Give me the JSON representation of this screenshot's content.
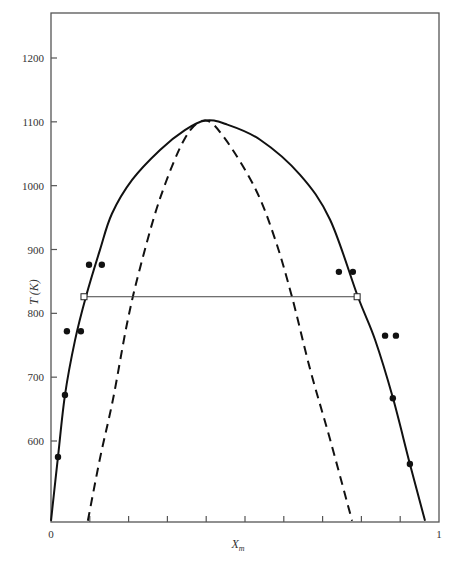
{
  "chart_data": {
    "type": "line",
    "title": "",
    "xlabel": "X_m",
    "xlabel_main": "X",
    "xlabel_sub": "m",
    "ylabel": "T (K)",
    "xlim": [
      0,
      1
    ],
    "ylim": [
      475,
      1270
    ],
    "x_tick_labels": [
      "0",
      "1"
    ],
    "x_ticks": [
      0,
      0.1,
      0.2,
      0.3,
      0.4,
      0.5,
      0.6,
      0.7,
      0.8,
      0.9,
      1.0
    ],
    "y_ticks": [
      600,
      700,
      800,
      900,
      1000,
      1100,
      1200
    ],
    "y_tick_labels": [
      "600",
      "700",
      "800",
      "900",
      "1000",
      "1100",
      "1200"
    ],
    "grid": false,
    "legend": null,
    "series": [
      {
        "name": "binodal (coexistence curve)",
        "style": "solid",
        "x": [
          0.0,
          0.018,
          0.036,
          0.062,
          0.09,
          0.126,
          0.157,
          0.209,
          0.281,
          0.345,
          0.397,
          0.448,
          0.539,
          0.642,
          0.719,
          0.791,
          0.835,
          0.881,
          0.925,
          0.964
        ],
        "y": [
          475,
          575,
          672,
          758,
          826,
          899,
          956,
          1009,
          1056,
          1087,
          1102,
          1097,
          1072,
          1017,
          947,
          826,
          759,
          668,
          564,
          475
        ]
      },
      {
        "name": "spinodal",
        "style": "dashed",
        "x": [
          0.095,
          0.126,
          0.16,
          0.196,
          0.229,
          0.281,
          0.345,
          0.397,
          0.448,
          0.526,
          0.577,
          0.621,
          0.668,
          0.719,
          0.776
        ],
        "y": [
          475,
          572,
          666,
          784,
          870,
          980,
          1074,
          1102,
          1074,
          996,
          917,
          826,
          712,
          603,
          475
        ]
      },
      {
        "name": "experimental points",
        "style": "markers",
        "x": [
          0.018,
          0.036,
          0.041,
          0.077,
          0.098,
          0.131,
          0.742,
          0.778,
          0.861,
          0.889,
          0.881,
          0.925
        ],
        "y": [
          575,
          672,
          772,
          772,
          876,
          876,
          865,
          865,
          765,
          765,
          667,
          564
        ]
      },
      {
        "name": "tie line",
        "style": "solid-thin",
        "x": [
          0.085,
          0.789
        ],
        "y": [
          826,
          826
        ]
      }
    ],
    "annotations": [
      "square markers at tie-line endpoints"
    ]
  },
  "axes": {
    "y_label": "T (K)",
    "x_label_main": "X",
    "x_label_sub": "m",
    "x_min_label": "0",
    "x_max_label": "1"
  }
}
